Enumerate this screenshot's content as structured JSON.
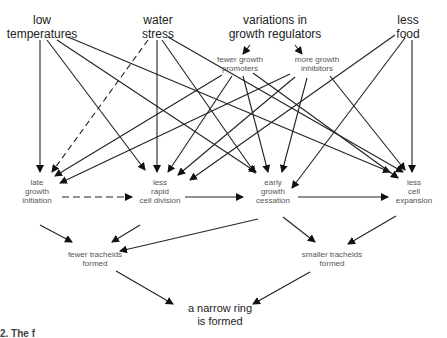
{
  "diagram": {
    "type": "flow",
    "top_factors": [
      {
        "id": "low_temp",
        "label": "low\ntemperatures"
      },
      {
        "id": "water_stress",
        "label": "water\nstress"
      },
      {
        "id": "growth_regulators",
        "label": "variations in\ngrowth regulators"
      },
      {
        "id": "less_food",
        "label": "less\nfood"
      }
    ],
    "regulator_effects": [
      {
        "id": "fewer_promoters",
        "label": "fewer growth\npromoters"
      },
      {
        "id": "more_inhibitors",
        "label": "more growth\ninhibitors"
      }
    ],
    "processes": [
      {
        "id": "late_init",
        "label": "late\ngrowth\ninitiation"
      },
      {
        "id": "less_division",
        "label": "less\nrapid\ncell division"
      },
      {
        "id": "early_cessation",
        "label": "early\ngrowth\ncessation"
      },
      {
        "id": "less_expansion",
        "label": "less\ncell\nexpansion"
      }
    ],
    "outcomes": [
      {
        "id": "fewer_tracheids",
        "label": "fewer tracheids\nformed"
      },
      {
        "id": "smaller_tracheids",
        "label": "smaller tracheids\nformed"
      }
    ],
    "result": {
      "id": "narrow_ring",
      "label": "a narrow ring\nis formed"
    },
    "edges": [
      {
        "from": "growth_regulators",
        "to": "fewer_promoters",
        "style": "solid"
      },
      {
        "from": "growth_regulators",
        "to": "more_inhibitors",
        "style": "solid"
      },
      {
        "from": "low_temp",
        "to": "late_init",
        "style": "solid"
      },
      {
        "from": "low_temp",
        "to": "less_division",
        "style": "solid"
      },
      {
        "from": "low_temp",
        "to": "early_cessation",
        "style": "solid"
      },
      {
        "from": "low_temp",
        "to": "less_expansion",
        "style": "solid"
      },
      {
        "from": "water_stress",
        "to": "late_init",
        "style": "dashed"
      },
      {
        "from": "water_stress",
        "to": "less_division",
        "style": "solid"
      },
      {
        "from": "water_stress",
        "to": "early_cessation",
        "style": "solid"
      },
      {
        "from": "water_stress",
        "to": "less_expansion",
        "style": "solid"
      },
      {
        "from": "fewer_promoters",
        "to": "late_init",
        "style": "solid"
      },
      {
        "from": "fewer_promoters",
        "to": "less_division",
        "style": "solid"
      },
      {
        "from": "fewer_promoters",
        "to": "early_cessation",
        "style": "solid"
      },
      {
        "from": "fewer_promoters",
        "to": "less_expansion",
        "style": "solid"
      },
      {
        "from": "more_inhibitors",
        "to": "late_init",
        "style": "solid"
      },
      {
        "from": "more_inhibitors",
        "to": "less_division",
        "style": "solid"
      },
      {
        "from": "more_inhibitors",
        "to": "early_cessation",
        "style": "solid"
      },
      {
        "from": "more_inhibitors",
        "to": "less_expansion",
        "style": "solid"
      },
      {
        "from": "less_food",
        "to": "less_division",
        "style": "solid"
      },
      {
        "from": "less_food",
        "to": "early_cessation",
        "style": "solid"
      },
      {
        "from": "less_food",
        "to": "less_expansion",
        "style": "solid"
      },
      {
        "from": "late_init",
        "to": "less_division",
        "style": "dashed"
      },
      {
        "from": "less_division",
        "to": "early_cessation",
        "style": "solid"
      },
      {
        "from": "early_cessation",
        "to": "less_expansion",
        "style": "solid"
      },
      {
        "from": "late_init",
        "to": "fewer_tracheids",
        "style": "solid"
      },
      {
        "from": "less_division",
        "to": "fewer_tracheids",
        "style": "solid"
      },
      {
        "from": "early_cessation",
        "to": "fewer_tracheids",
        "style": "solid"
      },
      {
        "from": "early_cessation",
        "to": "smaller_tracheids",
        "style": "solid"
      },
      {
        "from": "less_expansion",
        "to": "smaller_tracheids",
        "style": "solid"
      },
      {
        "from": "fewer_tracheids",
        "to": "narrow_ring",
        "style": "solid"
      },
      {
        "from": "smaller_tracheids",
        "to": "narrow_ring",
        "style": "solid"
      }
    ]
  },
  "caption": "2.  The f"
}
